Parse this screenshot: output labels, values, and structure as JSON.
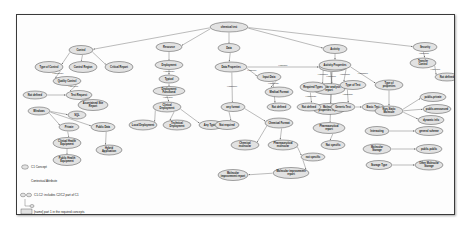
{
  "figure": {
    "kind": "concept-map",
    "root": "chemical test"
  },
  "nodes": [
    {
      "id": "root",
      "label": "chemical test",
      "x": 212,
      "y": 12,
      "rx": 19,
      "ry": 5
    },
    {
      "id": "control",
      "label": "Control",
      "x": 64,
      "y": 35,
      "rx": 12,
      "ry": 4.5
    },
    {
      "id": "typeofcontrol",
      "label": "Type of Control",
      "x": 32,
      "y": 52,
      "rx": 14,
      "ry": 5.5
    },
    {
      "id": "controlregion",
      "label": "Control Region",
      "x": 66,
      "y": 52,
      "rx": 14,
      "ry": 5.5
    },
    {
      "id": "criticalreport",
      "label": "Critical Report",
      "x": 102,
      "y": 52,
      "rx": 14,
      "ry": 5.5
    },
    {
      "id": "qualitycontrol",
      "label": "Quality Control",
      "x": 50,
      "y": 66,
      "rx": 14,
      "ry": 4.5
    },
    {
      "id": "notdefined1",
      "label": "Not defined",
      "x": 18,
      "y": 80,
      "rx": 12,
      "ry": 4
    },
    {
      "id": "testrequest",
      "label": "Test Request",
      "x": 62,
      "y": 80,
      "rx": 13,
      "ry": 4.5
    },
    {
      "id": "ascertain",
      "label": "Ascertained Site Report",
      "x": 76,
      "y": 90,
      "rx": 15,
      "ry": 5.5
    },
    {
      "id": "windows",
      "label": "Windows",
      "x": 22,
      "y": 96,
      "rx": 11,
      "ry": 4
    },
    {
      "id": "sql",
      "label": "SQL",
      "x": 60,
      "y": 100,
      "rx": 9,
      "ry": 4
    },
    {
      "id": "private",
      "label": "Private",
      "x": 52,
      "y": 112,
      "rx": 10,
      "ry": 4
    },
    {
      "id": "publicdata",
      "label": "Public Data",
      "x": 86,
      "y": 112,
      "rx": 12,
      "ry": 4.5
    },
    {
      "id": "clinicalhealth",
      "label": "Clinical Health Equipment",
      "x": 50,
      "y": 128,
      "rx": 14,
      "ry": 5.5
    },
    {
      "id": "publichealth",
      "label": "Public Health Equipment",
      "x": 50,
      "y": 145,
      "rx": 14,
      "ry": 5.5
    },
    {
      "id": "hybridapp",
      "label": "Hybrid Application",
      "x": 92,
      "y": 135,
      "rx": 13,
      "ry": 5
    },
    {
      "id": "resource",
      "label": "Resource",
      "x": 152,
      "y": 32,
      "rx": 13,
      "ry": 4.5
    },
    {
      "id": "deployment",
      "label": "Deployment",
      "x": 152,
      "y": 50,
      "rx": 14,
      "ry": 4.5
    },
    {
      "id": "typical",
      "label": "Typical",
      "x": 152,
      "y": 64,
      "rx": 10,
      "ry": 4
    },
    {
      "id": "deploymentfunc",
      "label": "Deployment Functional",
      "x": 152,
      "y": 76,
      "rx": 16,
      "ry": 4.5
    },
    {
      "id": "clinical",
      "label": "Clinical Deployment",
      "x": 150,
      "y": 92,
      "rx": 14,
      "ry": 5
    },
    {
      "id": "localdeploy",
      "label": "Local Deployment",
      "x": 126,
      "y": 110,
      "rx": 14,
      "ry": 5
    },
    {
      "id": "techdeploy",
      "label": "Technical Deployment",
      "x": 160,
      "y": 110,
      "rx": 14,
      "ry": 5
    },
    {
      "id": "anytypical",
      "label": "Any Typical",
      "x": 194,
      "y": 110,
      "rx": 12,
      "ry": 4.5
    },
    {
      "id": "data",
      "label": "Data",
      "x": 212,
      "y": 33,
      "rx": 11,
      "ry": 4.5
    },
    {
      "id": "dataproperties",
      "label": "Data Properties",
      "x": 214,
      "y": 52,
      "rx": 16,
      "ry": 5
    },
    {
      "id": "inputdata",
      "label": "Input Data",
      "x": 252,
      "y": 62,
      "rx": 12,
      "ry": 4.5
    },
    {
      "id": "medicalformat",
      "label": "Medical Format",
      "x": 262,
      "y": 77,
      "rx": 14,
      "ry": 5
    },
    {
      "id": "notdefined2",
      "label": "Not defined",
      "x": 262,
      "y": 92,
      "rx": 12,
      "ry": 4
    },
    {
      "id": "anyformat",
      "label": "any format",
      "x": 216,
      "y": 92,
      "rx": 12,
      "ry": 4.5
    },
    {
      "id": "notrequired",
      "label": "Not required",
      "x": 210,
      "y": 110,
      "rx": 12,
      "ry": 4.5
    },
    {
      "id": "chemicalformat",
      "label": "Chemical Format",
      "x": 262,
      "y": 108,
      "rx": 14,
      "ry": 5
    },
    {
      "id": "chemicalmolec",
      "label": "Chemical molecular",
      "x": 228,
      "y": 130,
      "rx": 14,
      "ry": 5
    },
    {
      "id": "pharmacomolec",
      "label": "Pharmaceutical molecular",
      "x": 266,
      "y": 130,
      "rx": 15,
      "ry": 5
    },
    {
      "id": "notspecific",
      "label": "not specific",
      "x": 296,
      "y": 142,
      "rx": 12,
      "ry": 4
    },
    {
      "id": "molecimprove",
      "label": "Molecular improvement report",
      "x": 274,
      "y": 158,
      "rx": 18,
      "ry": 5.5
    },
    {
      "id": "molecimprove2",
      "label": "Molecular improvement report",
      "x": 216,
      "y": 160,
      "rx": 15,
      "ry": 5.5
    },
    {
      "id": "outputdata",
      "label": "Output Data",
      "x": 316,
      "y": 52,
      "rx": 14,
      "ry": 4.5
    },
    {
      "id": "molecanalysis",
      "label": "Molecular analysis report",
      "x": 312,
      "y": 74,
      "rx": 16,
      "ry": 5.5
    },
    {
      "id": "molecprop",
      "label": "Molecular properties report",
      "x": 312,
      "y": 94,
      "rx": 16,
      "ry": 5.5
    },
    {
      "id": "pharmareport",
      "label": "Pharmaceutical report",
      "x": 312,
      "y": 113,
      "rx": 16,
      "ry": 5.5
    },
    {
      "id": "notspecific2",
      "label": "Not specific",
      "x": 316,
      "y": 130,
      "rx": 12,
      "ry": 4.5
    },
    {
      "id": "activity",
      "label": "Activity",
      "x": 318,
      "y": 34,
      "rx": 12,
      "ry": 4.5
    },
    {
      "id": "actproperties",
      "label": "Activity Properties",
      "x": 318,
      "y": 50,
      "rx": 16,
      "ry": 5
    },
    {
      "id": "requiredtypes",
      "label": "Required Types",
      "x": 296,
      "y": 72,
      "rx": 13,
      "ry": 5
    },
    {
      "id": "typeoftest",
      "label": "Type of Test",
      "x": 336,
      "y": 70,
      "rx": 13,
      "ry": 4.5
    },
    {
      "id": "notdefined3",
      "label": "Not defined",
      "x": 292,
      "y": 92,
      "rx": 12,
      "ry": 4
    },
    {
      "id": "generictest",
      "label": "Generic Test",
      "x": 326,
      "y": 92,
      "rx": 12,
      "ry": 4.5
    },
    {
      "id": "basictest",
      "label": "Basic Test",
      "x": 356,
      "y": 92,
      "rx": 11,
      "ry": 4
    },
    {
      "id": "typeofprop",
      "label": "Type of properties",
      "x": 372,
      "y": 70,
      "rx": 14,
      "ry": 5
    },
    {
      "id": "nonstaticmolec",
      "label": "Non-Static Molecule",
      "x": 372,
      "y": 96,
      "rx": 14,
      "ry": 5
    },
    {
      "id": "publicprivate",
      "label": "public-private",
      "x": 416,
      "y": 82,
      "rx": 13,
      "ry": 4.5
    },
    {
      "id": "publicannounce",
      "label": "public-announced",
      "x": 420,
      "y": 94,
      "rx": 14,
      "ry": 4.5
    },
    {
      "id": "dynamicinfo",
      "label": "dynamic info",
      "x": 414,
      "y": 105,
      "rx": 13,
      "ry": 4.5
    },
    {
      "id": "interacting",
      "label": "Interacting",
      "x": 360,
      "y": 116,
      "rx": 12,
      "ry": 4.5
    },
    {
      "id": "generalscheme",
      "label": "general scheme",
      "x": 412,
      "y": 116,
      "rx": 14,
      "ry": 4.5
    },
    {
      "id": "molecstorage",
      "label": "Molecular Storage",
      "x": 360,
      "y": 134,
      "rx": 14,
      "ry": 5
    },
    {
      "id": "publicpublic",
      "label": "public-public",
      "x": 412,
      "y": 134,
      "rx": 13,
      "ry": 4.5
    },
    {
      "id": "storagetype",
      "label": "Storage Type",
      "x": 362,
      "y": 150,
      "rx": 13,
      "ry": 4.5
    },
    {
      "id": "othermolec",
      "label": "Other Molecular Storage",
      "x": 412,
      "y": 150,
      "rx": 14,
      "ry": 5
    },
    {
      "id": "security",
      "label": "Security",
      "x": 408,
      "y": 32,
      "rx": 12,
      "ry": 4.5
    },
    {
      "id": "transfercontrol",
      "label": "Transfer Control",
      "x": 406,
      "y": 48,
      "rx": 13,
      "ry": 5
    },
    {
      "id": "notdefined4",
      "label": "Not defined",
      "x": 430,
      "y": 62,
      "rx": 12,
      "ry": 4
    }
  ],
  "edges": [
    {
      "from": "root",
      "to": "control",
      "label": ""
    },
    {
      "from": "root",
      "to": "resource",
      "label": ""
    },
    {
      "from": "root",
      "to": "data",
      "label": ""
    },
    {
      "from": "root",
      "to": "activity",
      "label": ""
    },
    {
      "from": "root",
      "to": "security",
      "label": ""
    },
    {
      "from": "control",
      "to": "typeofcontrol",
      "label": ""
    },
    {
      "from": "control",
      "to": "controlregion",
      "label": ""
    },
    {
      "from": "control",
      "to": "criticalreport",
      "label": ""
    },
    {
      "from": "typeofcontrol",
      "to": "qualitycontrol",
      "label": "HasRange"
    },
    {
      "from": "qualitycontrol",
      "to": "testrequest",
      "label": "HasValue"
    },
    {
      "from": "notdefined1",
      "to": "testrequest",
      "label": ""
    },
    {
      "from": "testrequest",
      "to": "ascertain",
      "label": ""
    },
    {
      "from": "windows",
      "to": "sql",
      "label": ""
    },
    {
      "from": "windows",
      "to": "private",
      "label": ""
    },
    {
      "from": "windows",
      "to": "publicdata",
      "label": ""
    },
    {
      "from": "private",
      "to": "clinicalhealth",
      "label": ""
    },
    {
      "from": "clinicalhealth",
      "to": "publichealth",
      "label": ""
    },
    {
      "from": "publicdata",
      "to": "hybridapp",
      "label": ""
    },
    {
      "from": "resource",
      "to": "deployment",
      "label": ""
    },
    {
      "from": "deployment",
      "to": "typical",
      "label": "HasRange"
    },
    {
      "from": "typical",
      "to": "deploymentfunc",
      "label": ""
    },
    {
      "from": "deploymentfunc",
      "to": "clinical",
      "label": "HasValue"
    },
    {
      "from": "clinical",
      "to": "localdeploy",
      "label": ""
    },
    {
      "from": "clinical",
      "to": "techdeploy",
      "label": ""
    },
    {
      "from": "clinical",
      "to": "anytypical",
      "label": ""
    },
    {
      "from": "data",
      "to": "dataproperties",
      "label": ""
    },
    {
      "from": "dataproperties",
      "to": "inputdata",
      "label": "HasMore"
    },
    {
      "from": "inputdata",
      "to": "medicalformat",
      "label": "HasRange"
    },
    {
      "from": "inputdata",
      "to": "notdefined2",
      "label": ""
    },
    {
      "from": "dataproperties",
      "to": "anyformat",
      "label": "HasName"
    },
    {
      "from": "anyformat",
      "to": "notrequired",
      "label": ""
    },
    {
      "from": "anyformat",
      "to": "chemicalformat",
      "label": ""
    },
    {
      "from": "chemicalformat",
      "to": "chemicalmolec",
      "label": ""
    },
    {
      "from": "chemicalformat",
      "to": "pharmacomolec",
      "label": ""
    },
    {
      "from": "pharmacomolec",
      "to": "notspecific",
      "label": ""
    },
    {
      "from": "notspecific",
      "to": "molecimprove",
      "label": ""
    },
    {
      "from": "molecimprove",
      "to": "molecimprove2",
      "label": ""
    },
    {
      "from": "dataproperties",
      "to": "outputdata",
      "label": "HasMore"
    },
    {
      "from": "outputdata",
      "to": "molecanalysis",
      "label": "HasValue"
    },
    {
      "from": "outputdata",
      "to": "molecprop",
      "label": ""
    },
    {
      "from": "outputdata",
      "to": "pharmareport",
      "label": ""
    },
    {
      "from": "pharmareport",
      "to": "notspecific2",
      "label": ""
    },
    {
      "from": "activity",
      "to": "actproperties",
      "label": ""
    },
    {
      "from": "actproperties",
      "to": "requiredtypes",
      "label": "HasName"
    },
    {
      "from": "actproperties",
      "to": "typeoftest",
      "label": "HasName"
    },
    {
      "from": "actproperties",
      "to": "typeofprop",
      "label": "HasName"
    },
    {
      "from": "requiredtypes",
      "to": "notdefined3",
      "label": "HasRange"
    },
    {
      "from": "typeoftest",
      "to": "generictest",
      "label": "HasName"
    },
    {
      "from": "generictest",
      "to": "basictest",
      "label": ""
    },
    {
      "from": "typeofprop",
      "to": "nonstaticmolec",
      "label": ""
    },
    {
      "from": "nonstaticmolec",
      "to": "publicprivate",
      "label": ""
    },
    {
      "from": "nonstaticmolec",
      "to": "publicannounce",
      "label": ""
    },
    {
      "from": "nonstaticmolec",
      "to": "dynamicinfo",
      "label": ""
    },
    {
      "from": "interacting",
      "to": "generalscheme",
      "label": ""
    },
    {
      "from": "molecstorage",
      "to": "publicpublic",
      "label": ""
    },
    {
      "from": "storagetype",
      "to": "othermolec",
      "label": ""
    },
    {
      "from": "security",
      "to": "transfercontrol",
      "label": "HasName"
    },
    {
      "from": "transfercontrol",
      "to": "notdefined4",
      "label": "HasValue"
    }
  ],
  "legend": {
    "items": [
      {
        "key": "concept",
        "glyph": "ellipse",
        "label": "C1 Concept"
      },
      {
        "key": "attribute",
        "glyph": "none",
        "label": "Contextual Attribute"
      },
      {
        "key": "includes",
        "glyph": "ellipse",
        "label": "C1-C2: includes C2/C2 part of C1"
      },
      {
        "key": "required",
        "glyph": "bracket",
        "label": "[name] part 1 in the required concepts"
      }
    ]
  }
}
